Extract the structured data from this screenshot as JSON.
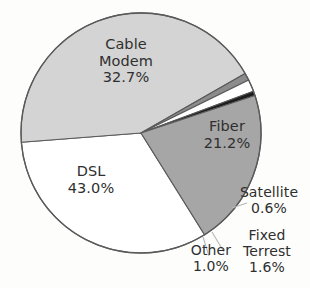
{
  "chart_data": {
    "type": "pie",
    "title": "",
    "subtitle": "",
    "xlabel": "",
    "ylabel": "",
    "legend_position": "none",
    "grid": false,
    "units": "percent",
    "label_format": "name + value%",
    "start_angle_deg": 58,
    "direction": "clockwise",
    "categories": [
      "Cable Modem",
      "DSL",
      "Other",
      "Fixed Terrest",
      "Satellite",
      "Fiber"
    ],
    "values": [
      32.7,
      43.0,
      1.0,
      1.6,
      0.6,
      21.2
    ],
    "slices": [
      {
        "name": "Cable Modem",
        "label_line1": "Cable",
        "label_line2": "Modem",
        "value": 32.7,
        "value_text": "32.7%",
        "color": "#ffffff",
        "label_placement": "inside"
      },
      {
        "name": "Fiber",
        "label_line1": "Fiber",
        "label_line2": "",
        "value": 21.2,
        "value_text": "21.2%",
        "color": "#a6a6a6",
        "label_placement": "inside"
      },
      {
        "name": "DSL",
        "label_line1": "DSL",
        "label_line2": "",
        "value": 43.0,
        "value_text": "43.0%",
        "color": "#d4d4d4",
        "label_placement": "inside"
      },
      {
        "name": "Satellite",
        "label_line1": "Satellite",
        "label_line2": "",
        "value": 0.6,
        "value_text": "0.6%",
        "color": "#1c1c1c",
        "label_placement": "outside"
      },
      {
        "name": "Fixed Terrest",
        "label_line1": "Fixed",
        "label_line2": "Terrest",
        "value": 1.6,
        "value_text": "1.6%",
        "color": "#ffffff",
        "label_placement": "outside"
      },
      {
        "name": "Other",
        "label_line1": "Other",
        "label_line2": "",
        "value": 1.0,
        "value_text": "1.0%",
        "color": "#8c8c8c",
        "label_placement": "outside"
      }
    ],
    "colors": {
      "outline": "#5a5a5a",
      "text": "#2f2f2f",
      "background": "#fdfdfc",
      "leader_line": "#b4b4b4"
    }
  }
}
